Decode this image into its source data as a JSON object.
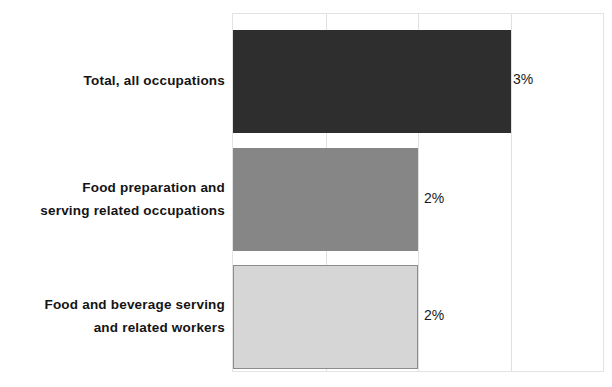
{
  "chart_data": {
    "type": "bar",
    "orientation": "horizontal",
    "title": "",
    "subtitle": "",
    "xlabel": "",
    "ylabel": "",
    "categories": [
      "Total, all occupations",
      "Food preparation and serving related occupations",
      "Food and beverage serving and related workers"
    ],
    "category_lines": [
      [
        "Total, all occupations"
      ],
      [
        "Food preparation and",
        "serving related occupations"
      ],
      [
        "Food and beverage serving",
        "and related workers"
      ]
    ],
    "values": [
      3,
      2,
      2
    ],
    "data_labels": [
      "3%",
      "2%",
      "2%"
    ],
    "xlim": [
      0,
      4
    ],
    "gridlines_x": [
      0,
      1,
      2,
      3,
      4
    ],
    "tick_labels_visible": false,
    "grid": true,
    "legend": "none",
    "bar_colors": [
      "#2e2e2e",
      "#868686",
      "#d6d6d6"
    ],
    "bar_border_colors": [
      "#2e2e2e",
      "#868686",
      "#8c8c8c"
    ],
    "note": "Chart is cropped: no axis tick labels or title are rendered in the visible pixels."
  },
  "axis": {
    "plot_border_color": "#e3e3e3",
    "gridline_color": "#e0e0e0"
  },
  "title_sliver": ""
}
